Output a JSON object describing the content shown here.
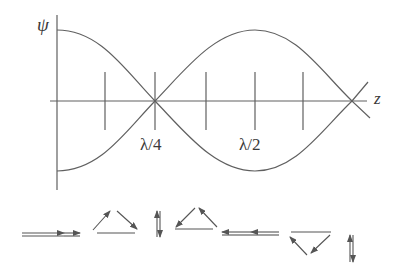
{
  "diagram": {
    "title": "",
    "y_axis_label": "ψ",
    "x_axis_label": "z",
    "tick_labels": [
      {
        "text": "λ/4",
        "position": "quarter wavelength (node)"
      },
      {
        "text": "λ/2",
        "position": "half wavelength (antinode)"
      }
    ],
    "curves": [
      {
        "name": "envelope-positive",
        "shape": "cosine",
        "start": "max"
      },
      {
        "name": "envelope-negative",
        "shape": "-cosine",
        "start": "min"
      }
    ],
    "tick_count": 5,
    "polarization_sequence": [
      "linear-right (double arrow →→)",
      "triangle up (rotating clockwise)",
      "vertical pair (↑↓)",
      "triangle up (rotating counter-clockwise)",
      "linear-left (double arrow ←←)",
      "triangle down",
      "vertical pair (↑↓)"
    ],
    "colors": {
      "line": "#555555",
      "text": "#3a3a3a",
      "background": "#ffffff"
    }
  }
}
